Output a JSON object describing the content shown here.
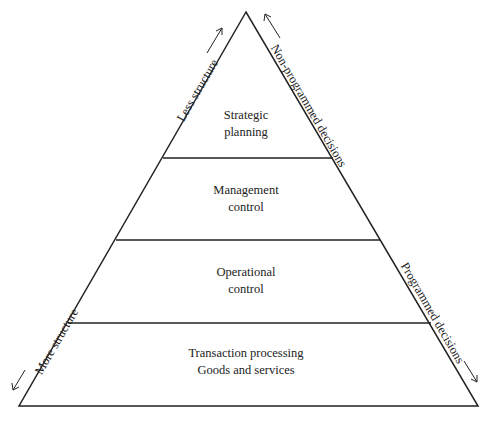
{
  "diagram": {
    "type": "pyramid",
    "levels": [
      {
        "line1": "Strategic",
        "line2": "planning"
      },
      {
        "line1": "Management",
        "line2": "control"
      },
      {
        "line1": "Operational",
        "line2": "control"
      },
      {
        "line1": "Transaction processing",
        "line2": "Goods and services"
      }
    ],
    "left_axis": {
      "top_label": "Less structure",
      "bottom_label": "More structure"
    },
    "right_axis": {
      "top_label": "Non-programmed decisions",
      "bottom_label": "Programmed decisions"
    },
    "colors": {
      "line": "#222222",
      "background": "#ffffff"
    }
  }
}
